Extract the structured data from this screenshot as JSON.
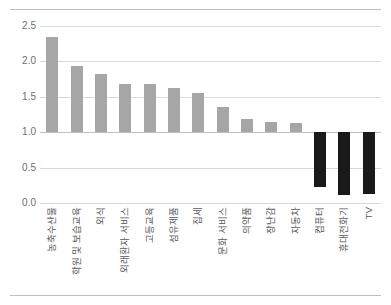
{
  "chart_data": {
    "type": "bar",
    "title": "",
    "subtitle": "",
    "xlabel": "",
    "ylabel": "",
    "ylim": [
      0.0,
      2.5
    ],
    "ytick_values": [
      0.0,
      0.5,
      1.0,
      1.5,
      2.0,
      2.5
    ],
    "ytick_labels": [
      "0.0",
      "0.5",
      "1.0",
      "1.5",
      "2.0",
      "2.5"
    ],
    "grid": true,
    "legend": "none",
    "baseline": 1.0,
    "bar_colors": {
      "above_baseline": "#a6a6a6",
      "below_baseline": "#1a1a1a",
      "gridline": "#d9d9d9",
      "baseline_line": "#bfbfbf"
    },
    "categories": [
      "농축수산물",
      "학원 및 보습교육",
      "외식",
      "외래환자 서비스",
      "고등교육",
      "섬유제품",
      "집세",
      "문화 서비스",
      "의약품",
      "장난감",
      "자동차",
      "컴퓨터",
      "휴대전화기",
      "TV"
    ],
    "values": [
      2.34,
      1.93,
      1.82,
      1.68,
      1.68,
      1.63,
      1.56,
      1.36,
      1.18,
      1.15,
      1.13,
      0.22,
      0.11,
      0.13
    ],
    "series": [
      {
        "name": "index",
        "values": [
          2.34,
          1.93,
          1.82,
          1.68,
          1.68,
          1.63,
          1.56,
          1.36,
          1.18,
          1.15,
          1.13,
          0.22,
          0.11,
          0.13
        ]
      }
    ]
  }
}
